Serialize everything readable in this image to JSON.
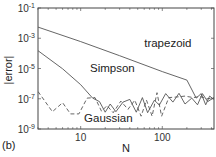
{
  "chart_data": {
    "type": "line",
    "title": "",
    "panel_label": "(b)",
    "xlabel": "N",
    "ylabel": "|error|",
    "xscale": "log",
    "yscale": "log",
    "xlim": [
      3,
      430
    ],
    "ylim": [
      1e-09,
      0.1
    ],
    "xticks": [
      {
        "value": 10,
        "label": "10"
      },
      {
        "value": 100,
        "label": "100"
      }
    ],
    "yticks": [
      {
        "value": 0.1,
        "base": "10",
        "exp": "-1"
      },
      {
        "value": 0.001,
        "base": "10",
        "exp": "-3"
      },
      {
        "value": 1e-05,
        "base": "10",
        "exp": "-5"
      },
      {
        "value": 1e-07,
        "base": "10",
        "exp": "-7"
      },
      {
        "value": 1e-09,
        "base": "10",
        "exp": "-9"
      }
    ],
    "grid": false,
    "legend": "inline annotations",
    "annotations": [
      {
        "text": "trapezoid",
        "x": 60,
        "y": 0.00025
      },
      {
        "text": "Simpson",
        "x": 13,
        "y": 6e-06
      },
      {
        "text": "Gaussian",
        "x": 11,
        "y": 3e-09
      }
    ],
    "series": [
      {
        "name": "trapezoid",
        "style": "solid",
        "points": [
          [
            3,
            0.0055
          ],
          [
            10,
            0.0006
          ],
          [
            30,
            7e-05
          ],
          [
            100,
            6.2e-06
          ],
          [
            200,
            1.7e-06
          ],
          [
            260,
            1.1e-07
          ],
          [
            300,
            2.2e-07
          ],
          [
            340,
            4e-08
          ],
          [
            380,
            1.5e-07
          ],
          [
            430,
            9e-08
          ]
        ]
      },
      {
        "name": "Simpson",
        "style": "solid",
        "points": [
          [
            3,
            0.00015
          ],
          [
            6,
            9.5e-06
          ],
          [
            10,
            8.5e-07
          ],
          [
            14,
            1.1e-07
          ],
          [
            17,
            6.5e-08
          ],
          [
            20,
            1.3e-08
          ],
          [
            23,
            4.5e-08
          ],
          [
            27,
            1.4e-08
          ],
          [
            33,
            6e-08
          ],
          [
            40,
            9e-08
          ],
          [
            48,
            1.3e-08
          ],
          [
            57,
            1.2e-07
          ],
          [
            66,
            1.2e-08
          ],
          [
            80,
            8e-08
          ],
          [
            92,
            3.8e-08
          ],
          [
            110,
            2.2e-07
          ],
          [
            135,
            6e-08
          ],
          [
            160,
            2.3e-07
          ],
          [
            190,
            4.5e-08
          ],
          [
            230,
            1.1e-07
          ],
          [
            270,
            4e-08
          ],
          [
            310,
            2.2e-07
          ],
          [
            360,
            6.5e-08
          ],
          [
            430,
            1.2e-07
          ]
        ]
      },
      {
        "name": "Gaussian",
        "style": "dashed",
        "points": [
          [
            3,
            3e-07
          ],
          [
            4.5,
            1.4e-08
          ],
          [
            6,
            5.5e-08
          ],
          [
            7.5,
            1e-08
          ],
          [
            9.5,
            1e-08
          ],
          [
            12,
            1.1e-07
          ],
          [
            15,
            1.2e-07
          ],
          [
            18,
            1.5e-08
          ],
          [
            21,
            3.5e-08
          ],
          [
            25,
            1.2e-08
          ],
          [
            31,
            7e-08
          ],
          [
            38,
            2e-08
          ],
          [
            46,
            8e-08
          ],
          [
            55,
            7e-09
          ],
          [
            64,
            8e-08
          ],
          [
            75,
            7e-09
          ],
          [
            86,
            2.5e-07
          ],
          [
            98,
            7e-09
          ],
          [
            120,
            1.2e-07
          ],
          [
            150,
            1.3e-07
          ],
          [
            190,
            1.5e-07
          ],
          [
            240,
            1.2e-07
          ],
          [
            290,
            1.4e-07
          ],
          [
            350,
            1e-07
          ],
          [
            430,
            1.1e-07
          ]
        ]
      }
    ]
  }
}
